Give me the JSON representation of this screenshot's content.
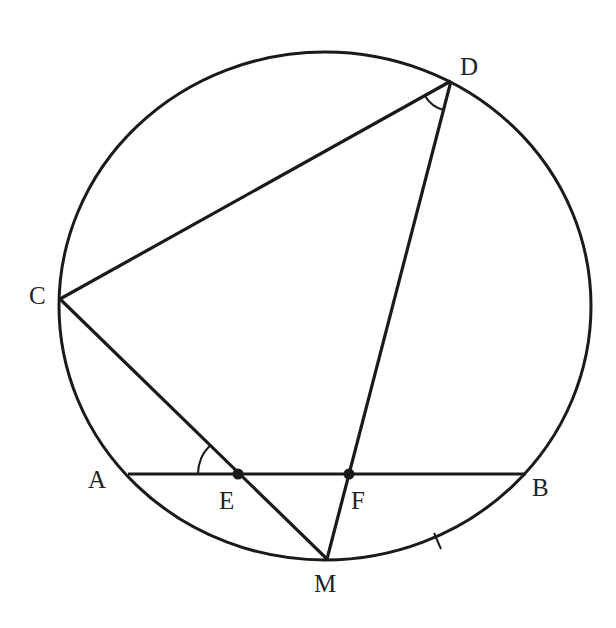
{
  "figure": {
    "stroke_color": "#1a1a1a",
    "background": "#ffffff"
  },
  "circle": {
    "cx": 325,
    "cy": 306,
    "rx": 266,
    "ry": 254
  },
  "points": {
    "A": {
      "label": "A",
      "x": 128,
      "y": 474,
      "label_x": 88,
      "label_y": 488
    },
    "B": {
      "label": "B",
      "x": 526,
      "y": 474,
      "label_x": 532,
      "label_y": 496
    },
    "C": {
      "label": "C",
      "x": 60,
      "y": 299,
      "label_x": 29,
      "label_y": 304
    },
    "D": {
      "label": "D",
      "x": 451,
      "y": 81,
      "label_x": 460,
      "label_y": 75
    },
    "E": {
      "label": "E",
      "x": 238,
      "y": 474,
      "label_x": 219,
      "label_y": 509
    },
    "F": {
      "label": "F",
      "x": 349,
      "y": 474,
      "label_x": 351,
      "label_y": 509
    },
    "M": {
      "label": "M",
      "x": 327,
      "y": 559,
      "label_x": 314,
      "label_y": 592
    }
  },
  "segments": [
    {
      "name": "chord-AB",
      "from": "A",
      "to": "B"
    },
    {
      "name": "segment-CD",
      "from": "C",
      "to": "D"
    },
    {
      "name": "segment-CM",
      "from": "C",
      "to": "M"
    },
    {
      "name": "segment-DM",
      "from": "D",
      "to": "M"
    }
  ],
  "angle_marks": [
    {
      "name": "angle-AEC",
      "vertex": "E"
    },
    {
      "name": "angle-CDM",
      "vertex": "D"
    }
  ],
  "tick_marks": [
    {
      "name": "arc-MB-tick",
      "note": "equal-arc tick on arc MB"
    }
  ]
}
